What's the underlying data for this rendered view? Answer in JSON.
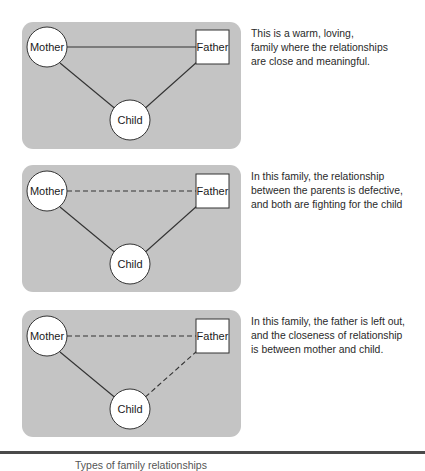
{
  "colors": {
    "panel_bg": "#c4c4c4",
    "node_fill": "#ffffff",
    "line": "#333333",
    "rule": "#4a4a4a"
  },
  "nodes": {
    "mother": "Mother",
    "father": "Father",
    "child": "Child"
  },
  "panels": [
    {
      "id": "close-family",
      "edges": {
        "mother_father": "solid",
        "mother_child": "solid",
        "father_child": "solid"
      },
      "description_lines": [
        "This is a warm, loving,",
        "family where the relationships",
        "are close and meaningful."
      ]
    },
    {
      "id": "parents-defective",
      "edges": {
        "mother_father": "dashed",
        "mother_child": "solid",
        "father_child": "solid"
      },
      "description_lines": [
        "In this family, the relationship",
        "between the parents is defective,",
        "and both are fighting for the child"
      ]
    },
    {
      "id": "father-left-out",
      "edges": {
        "mother_father": "dashed",
        "mother_child": "solid",
        "father_child": "dashed"
      },
      "description_lines": [
        "In this family, the father is left out,",
        "and the closeness of relationship",
        "is between mother and child."
      ]
    }
  ],
  "caption": "Types of family relationships"
}
